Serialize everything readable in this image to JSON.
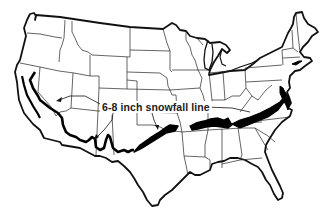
{
  "map": {
    "title": "Contiguous United States outline map",
    "region": "Contiguous United States",
    "style": "black-and-white outline with state boundaries",
    "colors": {
      "background": "#ffffff",
      "outline": "#111111",
      "snowfall_band": "#000000"
    },
    "annotation": {
      "label": "6-8 inch snowfall line",
      "arrow_count": 3
    },
    "features": [
      {
        "name": "state-boundaries",
        "type": "lines"
      },
      {
        "name": "national-border",
        "type": "thick-outline"
      },
      {
        "name": "snowfall-line",
        "type": "thick-black-band",
        "extent": "Southern California through Arizona, New Mexico, Texas Panhandle/Oklahoma, Arkansas/Tennessee, to Virginia/Chesapeake coast"
      }
    ]
  }
}
